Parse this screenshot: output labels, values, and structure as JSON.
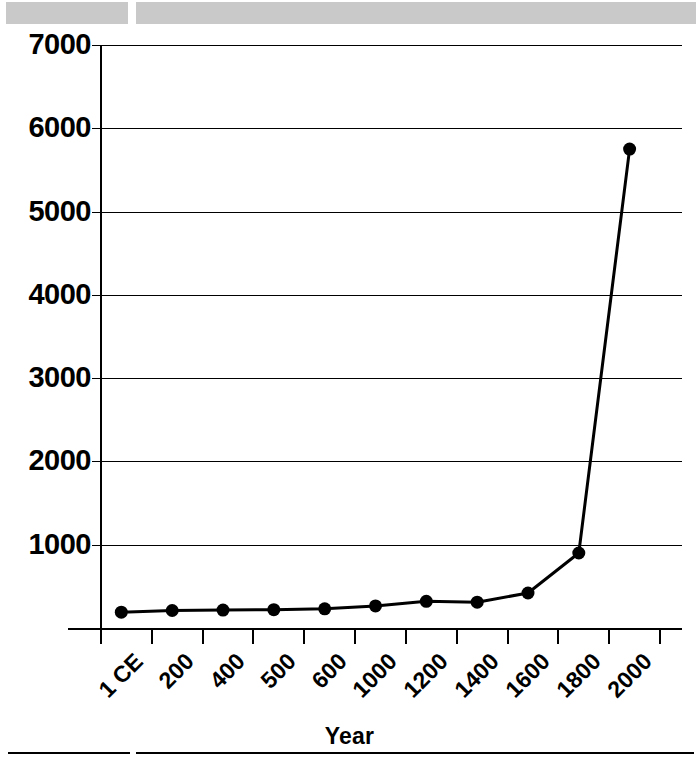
{
  "top_band": {
    "segments": [
      "scan-band-left",
      "scan-band-right"
    ]
  },
  "chart_data": {
    "type": "line",
    "title": "",
    "subtitle": "",
    "xlabel": "Year",
    "ylabel": "",
    "grid": true,
    "legend": "none",
    "categories": [
      "1 CE",
      "200",
      "400",
      "500",
      "600",
      "1000",
      "1200",
      "1400",
      "1600",
      "1800",
      "2000"
    ],
    "values": [
      190,
      210,
      215,
      220,
      230,
      265,
      320,
      310,
      420,
      900,
      5750
    ],
    "ylim": [
      0,
      7000
    ],
    "yticks": [
      1000,
      2000,
      3000,
      4000,
      5000,
      6000,
      7000
    ],
    "ytick_labels": [
      "1000",
      "2000",
      "3000",
      "4000",
      "5000",
      "6000",
      "7000"
    ],
    "marker": "circle",
    "marker_color": "#000000",
    "line_color": "#000000",
    "line_width": 3
  },
  "axis": {
    "x_title": "Year",
    "y_title": ""
  },
  "colors": {
    "band": "#c9c9c9",
    "ink": "#000000",
    "paper": "#ffffff"
  }
}
